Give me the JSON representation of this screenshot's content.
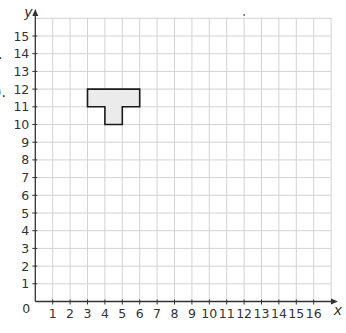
{
  "clipped_text": {
    "top_fragment": "·",
    "mid_fragment": ")."
  },
  "colors": {
    "grid": "#d3d3d3",
    "axis": "#333333",
    "shape_fill": "#ebebeb",
    "shape_stroke": "#1a1a1a",
    "label": "#333333"
  },
  "chart_data": {
    "type": "coordinate-grid",
    "title": "",
    "xlabel": "x",
    "ylabel": "y",
    "xlim": [
      0,
      16
    ],
    "ylim": [
      0,
      15
    ],
    "grid": true,
    "x_ticks": [
      "1",
      "2",
      "3",
      "4",
      "5",
      "6",
      "7",
      "8",
      "9",
      "10",
      "11",
      "12",
      "13",
      "14",
      "15",
      "16"
    ],
    "y_ticks": [
      "1",
      "2",
      "3",
      "4",
      "5",
      "6",
      "7",
      "8",
      "9",
      "10",
      "11",
      "12",
      "13",
      "14",
      "15"
    ],
    "origin_label": "0",
    "shapes": [
      {
        "name": "T-shape",
        "vertices": [
          [
            3,
            12
          ],
          [
            6,
            12
          ],
          [
            6,
            11
          ],
          [
            5,
            11
          ],
          [
            5,
            10
          ],
          [
            4,
            10
          ],
          [
            4,
            11
          ],
          [
            3,
            11
          ]
        ]
      }
    ]
  }
}
